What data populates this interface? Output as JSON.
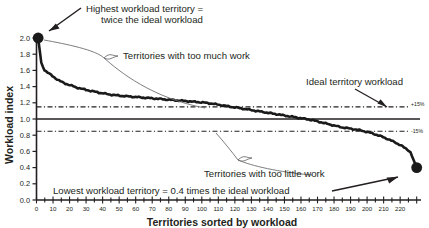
{
  "chart_data": {
    "type": "line",
    "title": "",
    "xlabel": "Territories sorted by workload",
    "ylabel": "Workload index",
    "xlim": [
      0,
      232
    ],
    "ylim": [
      0.0,
      2.0
    ],
    "grid": false,
    "legend_position": "none",
    "x_ticks": [
      0,
      10,
      20,
      30,
      40,
      50,
      60,
      70,
      80,
      90,
      100,
      110,
      120,
      130,
      140,
      150,
      160,
      170,
      180,
      190,
      200,
      210,
      220
    ],
    "y_ticks": [
      "0.0",
      "0.2",
      "0.4",
      "0.6",
      "0.8",
      "1.0",
      "1.2",
      "1.4",
      "1.6",
      "1.8",
      "2.0"
    ],
    "series": [
      {
        "name": "Workload index by territory",
        "x": [
          1,
          3,
          5,
          7,
          9,
          11,
          14,
          17,
          20,
          24,
          28,
          32,
          37,
          42,
          47,
          52,
          58,
          64,
          70,
          76,
          82,
          88,
          94,
          100,
          106,
          112,
          118,
          124,
          130,
          136,
          142,
          148,
          154,
          160,
          166,
          172,
          178,
          184,
          190,
          196,
          202,
          208,
          214,
          220,
          226,
          230
        ],
        "values": [
          2.0,
          1.68,
          1.6,
          1.57,
          1.54,
          1.51,
          1.47,
          1.44,
          1.42,
          1.39,
          1.37,
          1.35,
          1.33,
          1.31,
          1.295,
          1.285,
          1.275,
          1.265,
          1.255,
          1.245,
          1.235,
          1.225,
          1.215,
          1.205,
          1.19,
          1.17,
          1.15,
          1.13,
          1.11,
          1.09,
          1.07,
          1.05,
          1.03,
          1.01,
          0.99,
          0.96,
          0.93,
          0.9,
          0.88,
          0.86,
          0.83,
          0.79,
          0.74,
          0.68,
          0.6,
          0.4
        ]
      }
    ],
    "reference_lines": [
      {
        "name": "ideal-workload-line",
        "value": 1.0,
        "style": "solid",
        "label": ""
      },
      {
        "name": "plus-15-line",
        "value": 1.15,
        "style": "dash-dot",
        "label": "+15%"
      },
      {
        "name": "minus-15-line",
        "value": 0.85,
        "style": "dash-dot",
        "label": "-15%"
      }
    ],
    "markers": [
      {
        "name": "highest-workload-point",
        "x": 1,
        "y": 2.0
      },
      {
        "name": "lowest-workload-point",
        "x": 230,
        "y": 0.4
      }
    ],
    "annotations": [
      {
        "name": "highest-workload-note",
        "line1": "Highest workload territory =",
        "line2": "twice the ideal workload"
      },
      {
        "name": "too-much-work-note",
        "text": "Territories with too much work"
      },
      {
        "name": "ideal-workload-note",
        "text": "Ideal  territory workload"
      },
      {
        "name": "too-little-work-note",
        "text": "Territories with too little work"
      },
      {
        "name": "lowest-workload-note",
        "text": "Lowest workload territory = 0.4 times the ideal  workload"
      }
    ],
    "band_labels": {
      "upper": "+15%",
      "lower": "-15%"
    }
  },
  "colors": {
    "ink": "#231f20",
    "curve": "#1a1a1a",
    "leader": "#58595b",
    "background": "#ffffff"
  }
}
